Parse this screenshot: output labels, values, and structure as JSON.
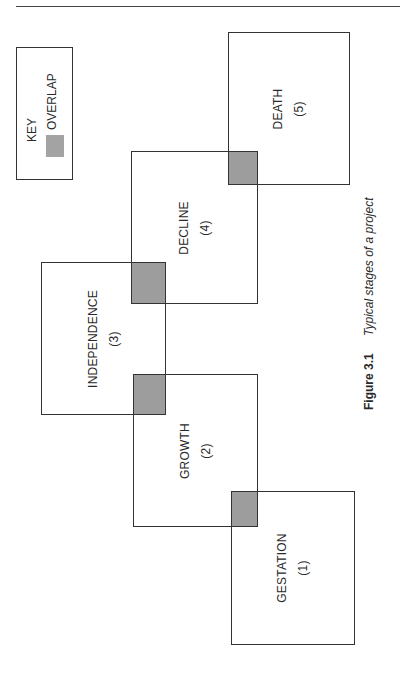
{
  "header": {
    "running_text": "...y of ... project management ... ...",
    "rule": true
  },
  "key": {
    "title": "KEY",
    "items": [
      {
        "label": "OVERLAP",
        "swatch_color": "#a3a3a3"
      }
    ]
  },
  "stages": [
    {
      "name": "GESTATION",
      "number": "(1)",
      "box": {
        "x": 231,
        "y": 491,
        "w": 124,
        "h": 154
      }
    },
    {
      "name": "GROWTH",
      "number": "(2)",
      "box": {
        "x": 133,
        "y": 374,
        "w": 125,
        "h": 153
      }
    },
    {
      "name": "INDEPENDENCE",
      "number": "(3)",
      "box": {
        "x": 41,
        "y": 262,
        "w": 125,
        "h": 153
      }
    },
    {
      "name": "DECLINE",
      "number": "(4)",
      "box": {
        "x": 131,
        "y": 151,
        "w": 127,
        "h": 153
      }
    },
    {
      "name": "DEATH",
      "number": "(5)",
      "box": {
        "x": 228,
        "y": 32,
        "w": 122,
        "h": 153
      }
    }
  ],
  "overlaps": [
    {
      "between": [
        "GROWTH",
        "GESTATION"
      ],
      "box": {
        "x": 231,
        "y": 491,
        "w": 27,
        "h": 36
      }
    },
    {
      "between": [
        "INDEPENDENCE",
        "GROWTH"
      ],
      "box": {
        "x": 133,
        "y": 374,
        "w": 33,
        "h": 41
      }
    },
    {
      "between": [
        "DECLINE",
        "INDEPENDENCE"
      ],
      "box": {
        "x": 131,
        "y": 262,
        "w": 35,
        "h": 42
      }
    },
    {
      "between": [
        "DEATH",
        "DECLINE"
      ],
      "box": {
        "x": 228,
        "y": 151,
        "w": 30,
        "h": 34
      }
    }
  ],
  "colors": {
    "overlap_fill": "#9d9d9d",
    "border": "#333333",
    "background": "#ffffff"
  },
  "caption": {
    "figure_number": "Figure 3.1",
    "title": "Typical stages of a project"
  }
}
